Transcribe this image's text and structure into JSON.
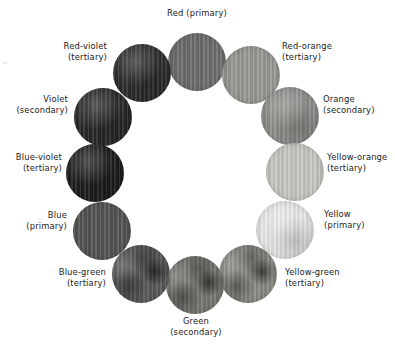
{
  "figure": {
    "name": "color-wheel",
    "background": "#ffffff",
    "note": "Grayscale reproduction of a twelve-hue artist's color wheel"
  },
  "margin_mark": "c",
  "chart_data": {
    "type": "pie",
    "title": "",
    "subtitle": "",
    "xlabel": "",
    "ylabel": "",
    "legend_position": "none",
    "grid": false,
    "layout": {
      "arrangement": "ring",
      "center_x": 197,
      "center_y": 175,
      "ring_radius": 110,
      "slice_count": 12,
      "slice_angle_deg": 30
    },
    "categories": [
      "Red",
      "Red-orange",
      "Orange",
      "Yellow-orange",
      "Yellow",
      "Yellow-green",
      "Green",
      "Blue-green",
      "Blue",
      "Blue-violet",
      "Violet",
      "Red-violet"
    ],
    "values": [
      1,
      1,
      1,
      1,
      1,
      1,
      1,
      1,
      1,
      1,
      1,
      1
    ],
    "annotations": [
      "primary",
      "tertiary",
      "secondary",
      "tertiary",
      "primary",
      "tertiary",
      "secondary",
      "tertiary",
      "primary",
      "tertiary",
      "secondary",
      "tertiary"
    ]
  },
  "swatches": [
    {
      "id": "red",
      "name": "Red",
      "classification": "(primary)",
      "label_lines": [
        "Red (primary)"
      ],
      "clock_position": 12,
      "angle_deg": 0,
      "gray_hex": "#6e6e6e",
      "texture": "ruled",
      "circle": {
        "left": 168,
        "top": 33,
        "size": 58
      },
      "label_box": {
        "left": 141,
        "top": 8,
        "width": 112,
        "align": "center"
      }
    },
    {
      "id": "red-orange",
      "name": "Red-orange",
      "classification": "(tertiary)",
      "label_lines": [
        "Red-orange",
        "(tertiary)"
      ],
      "clock_position": 1,
      "angle_deg": 30,
      "gray_hex": "#9a9a95",
      "texture": "ruled",
      "circle": {
        "left": 222,
        "top": 46,
        "size": 58
      },
      "label_box": {
        "left": 282,
        "top": 41,
        "width": 104,
        "align": "left"
      }
    },
    {
      "id": "orange",
      "name": "Orange",
      "classification": "(secondary)",
      "label_lines": [
        "Orange",
        "(secondary)"
      ],
      "clock_position": 2,
      "angle_deg": 60,
      "gray_hex": "#8f8f8b",
      "texture": "soft",
      "circle": {
        "left": 261,
        "top": 87,
        "size": 58
      },
      "label_box": {
        "left": 323,
        "top": 94,
        "width": 66,
        "align": "left"
      }
    },
    {
      "id": "yellow-orange",
      "name": "Yellow-orange",
      "classification": "(tertiary)",
      "label_lines": [
        "Yellow-orange",
        "(tertiary)"
      ],
      "clock_position": 3,
      "angle_deg": 90,
      "gray_hex": "#c9c9c4",
      "texture": "ruled",
      "circle": {
        "left": 266,
        "top": 143,
        "size": 58
      },
      "label_box": {
        "left": 327,
        "top": 152,
        "width": 66,
        "align": "left"
      }
    },
    {
      "id": "yellow",
      "name": "Yellow",
      "classification": "(primary)",
      "label_lines": [
        "Yellow",
        "(primary)"
      ],
      "clock_position": 4,
      "angle_deg": 120,
      "gray_hex": "#e8e8e6",
      "texture": "soft",
      "circle": {
        "left": 256,
        "top": 201,
        "size": 58
      },
      "label_box": {
        "left": 324,
        "top": 209,
        "width": 66,
        "align": "left"
      }
    },
    {
      "id": "yellow-green",
      "name": "Yellow-green",
      "classification": "(tertiary)",
      "label_lines": [
        "Yellow-green",
        "(tertiary)"
      ],
      "clock_position": 5,
      "angle_deg": 150,
      "gray_hex": "#8a8a84",
      "texture": "mottled",
      "circle": {
        "left": 219,
        "top": 245,
        "size": 58
      },
      "label_box": {
        "left": 285,
        "top": 267,
        "width": 104,
        "align": "left"
      }
    },
    {
      "id": "green",
      "name": "Green",
      "classification": "(secondary)",
      "label_lines": [
        "Green",
        "(secondary)"
      ],
      "clock_position": 6,
      "angle_deg": 180,
      "gray_hex": "#777772",
      "texture": "mottled",
      "circle": {
        "left": 166,
        "top": 256,
        "size": 58
      },
      "label_box": {
        "left": 142,
        "top": 316,
        "width": 108,
        "align": "center"
      }
    },
    {
      "id": "blue-green",
      "name": "Blue-green",
      "classification": "(tertiary)",
      "label_lines": [
        "Blue-green",
        "(tertiary)"
      ],
      "clock_position": 7,
      "angle_deg": 210,
      "gray_hex": "#5a5a58",
      "texture": "mottled",
      "circle": {
        "left": 112,
        "top": 245,
        "size": 58
      },
      "label_box": {
        "left": 8,
        "top": 267,
        "width": 98,
        "align": "right"
      }
    },
    {
      "id": "blue",
      "name": "Blue",
      "classification": "(primary)",
      "label_lines": [
        "Blue",
        "(primary)"
      ],
      "clock_position": 8,
      "angle_deg": 240,
      "gray_hex": "#555553",
      "texture": "ruled",
      "circle": {
        "left": 73,
        "top": 202,
        "size": 58
      },
      "label_box": {
        "left": 3,
        "top": 210,
        "width": 64,
        "align": "right"
      }
    },
    {
      "id": "blue-violet",
      "name": "Blue-violet",
      "classification": "(tertiary)",
      "label_lines": [
        "Blue-violet",
        "(tertiary)"
      ],
      "clock_position": 9,
      "angle_deg": 270,
      "gray_hex": "#1f1f22",
      "texture": "soft",
      "circle": {
        "left": 66,
        "top": 144,
        "size": 58
      },
      "label_box": {
        "left": 2,
        "top": 152,
        "width": 60,
        "align": "right"
      }
    },
    {
      "id": "violet",
      "name": "Violet",
      "classification": "(secondary)",
      "label_lines": [
        "Violet",
        "(secondary)"
      ],
      "clock_position": 10,
      "angle_deg": 300,
      "gray_hex": "#2a2a2c",
      "texture": "soft",
      "circle": {
        "left": 74,
        "top": 88,
        "size": 58
      },
      "label_box": {
        "left": 2,
        "top": 94,
        "width": 66,
        "align": "right"
      }
    },
    {
      "id": "red-violet",
      "name": "Red-violet",
      "classification": "(tertiary)",
      "label_lines": [
        "Red-violet",
        "(tertiary)"
      ],
      "clock_position": 11,
      "angle_deg": 330,
      "gray_hex": "#2e2e30",
      "texture": "soft",
      "circle": {
        "left": 113,
        "top": 44,
        "size": 58
      },
      "label_box": {
        "left": 8,
        "top": 41,
        "width": 99,
        "align": "right"
      }
    }
  ]
}
